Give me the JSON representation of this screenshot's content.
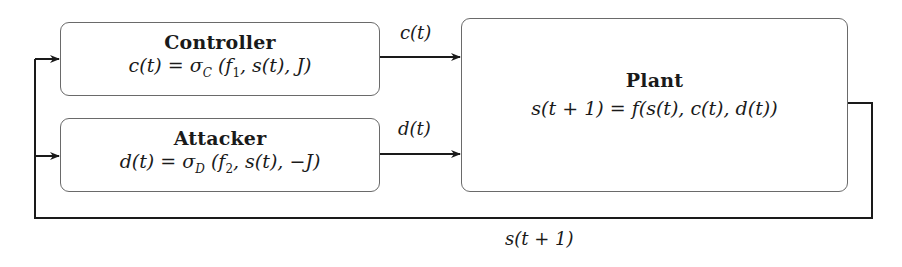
{
  "diagram": {
    "type": "block-diagram",
    "nodes": [
      {
        "id": "controller",
        "title": "Controller",
        "equation": "c(t) = σC (f1, s(t), J)",
        "eq_parts": {
          "lhs": "c(t)",
          "sigma": "σ",
          "sub": "C",
          "args": "(f",
          "arg_sub": "1",
          "rest": ", s(t), J)"
        }
      },
      {
        "id": "attacker",
        "title": "Attacker",
        "equation": "d(t) = σD (f2, s(t), −J)",
        "eq_parts": {
          "lhs": "d(t)",
          "sigma": "σ",
          "sub": "D",
          "args": "(f",
          "arg_sub": "2",
          "rest": ", s(t), −J)"
        }
      },
      {
        "id": "plant",
        "title": "Plant",
        "equation": "s(t + 1) = f(s(t), c(t), d(t))",
        "eq_parts": {
          "lhs": "s(t + 1)",
          "rhs": "f(s(t), c(t), d(t))"
        }
      }
    ],
    "edges": [
      {
        "from": "controller",
        "to": "plant",
        "label": "c(t)"
      },
      {
        "from": "attacker",
        "to": "plant",
        "label": "d(t)"
      },
      {
        "from": "plant",
        "to": "controller",
        "label": "s(t + 1)"
      },
      {
        "from": "plant",
        "to": "attacker",
        "label": "s(t + 1)"
      }
    ],
    "equals": "="
  }
}
